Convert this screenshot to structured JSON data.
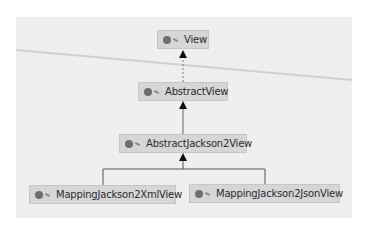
{
  "diagram": {
    "type": "class-hierarchy",
    "nodes": [
      {
        "id": "view",
        "label": "View",
        "icon": "interface-icon",
        "kind": "interface"
      },
      {
        "id": "abstract-view",
        "label": "AbstractView",
        "icon": "abstract-class-icon",
        "kind": "abstract-class"
      },
      {
        "id": "abstract-jackson2-view",
        "label": "AbstractJackson2View",
        "icon": "abstract-class-icon",
        "kind": "abstract-class"
      },
      {
        "id": "mapping-jackson2-xml-view",
        "label": "MappingJackson2XmlView",
        "icon": "class-icon",
        "kind": "class"
      },
      {
        "id": "mapping-jackson2-json-view",
        "label": "MappingJackson2JsonView",
        "icon": "class-icon",
        "kind": "class"
      }
    ],
    "edges": [
      {
        "from": "abstract-view",
        "to": "view",
        "style": "dashed",
        "relation": "implements"
      },
      {
        "from": "abstract-jackson2-view",
        "to": "abstract-view",
        "style": "solid",
        "relation": "extends"
      },
      {
        "from": "mapping-jackson2-xml-view",
        "to": "abstract-jackson2-view",
        "style": "solid",
        "relation": "extends"
      },
      {
        "from": "mapping-jackson2-json-view",
        "to": "abstract-jackson2-view",
        "style": "solid",
        "relation": "extends"
      }
    ]
  },
  "colors": {
    "panel_bg": "#efefef",
    "node_bg": "#d6d6d6",
    "node_border": "#c6c6c6",
    "edge": "#555555",
    "arrowhead": "#111111"
  }
}
